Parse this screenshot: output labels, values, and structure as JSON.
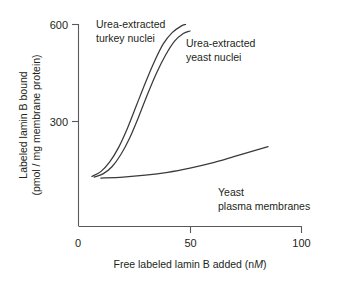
{
  "chart_data": {
    "type": "line",
    "title": "",
    "xlabel": "Free labeled lamin B added (nM)",
    "xlabel_prefix": "Free labeled lamin B added (n",
    "xlabel_italic": "M",
    "xlabel_suffix": ")",
    "ylabel_line1": "Labeled lamin B bound",
    "ylabel_line2": "(pmol / mg membrane protein)",
    "xlim": [
      0,
      100
    ],
    "ylim": [
      0,
      640
    ],
    "xticks": [
      "0",
      "50",
      "100"
    ],
    "xtick_values": [
      0,
      50,
      100
    ],
    "yticks": [
      "300",
      "600"
    ],
    "ytick_values": [
      300,
      600
    ],
    "grid": false,
    "legend_position": "inline-annotations",
    "series": [
      {
        "name": "Urea-extracted turkey nuclei",
        "label_line1": "Urea-extracted",
        "label_line2": "turkey nuclei",
        "color": "#3a3a3c",
        "x": [
          6,
          10,
          14,
          18,
          22,
          26,
          30,
          34,
          38,
          42,
          46,
          48
        ],
        "values": [
          130,
          145,
          175,
          220,
          280,
          350,
          420,
          485,
          540,
          575,
          595,
          600
        ]
      },
      {
        "name": "Urea-extracted yeast nuclei",
        "label_line1": "Urea-extracted",
        "label_line2": "yeast nuclei",
        "color": "#3a3a3c",
        "x": [
          7,
          11,
          15,
          19,
          23,
          27,
          31,
          35,
          39,
          43,
          47,
          50
        ],
        "values": [
          128,
          138,
          160,
          198,
          250,
          315,
          385,
          450,
          505,
          548,
          572,
          580
        ]
      },
      {
        "name": "Yeast plasma membranes",
        "label_line1": "Yeast",
        "label_line2": "plasma membranes",
        "color": "#3a3a3c",
        "x": [
          10,
          20,
          30,
          40,
          50,
          60,
          70,
          80,
          85
        ],
        "values": [
          125,
          128,
          134,
          143,
          156,
          172,
          192,
          212,
          222
        ]
      }
    ],
    "annotations": [
      {
        "text": "Urea-extracted turkey nuclei",
        "x": 25,
        "y": 560
      },
      {
        "text": "Urea-extracted yeast nuclei",
        "x": 52,
        "y": 500
      },
      {
        "text": "Yeast plasma membranes",
        "x": 62,
        "y": 150
      }
    ]
  }
}
